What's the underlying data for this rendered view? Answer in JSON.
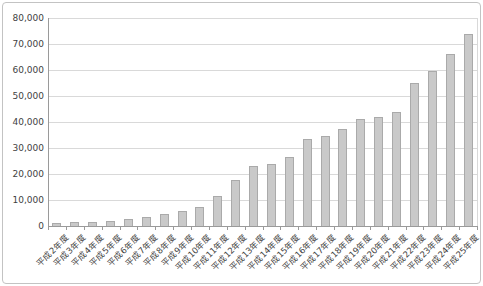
{
  "chart_data": {
    "type": "bar",
    "title": "",
    "xlabel": "",
    "ylabel": "",
    "categories": [
      "平成2年度",
      "平成3年度",
      "平成4年度",
      "平成5年度",
      "平成6年度",
      "平成7年度",
      "平成8年度",
      "平成9年度",
      "平成10年度",
      "平成11年度",
      "平成12年度",
      "平成13年度",
      "平成14年度",
      "平成15年度",
      "平成16年度",
      "平成17年度",
      "平成18年度",
      "平成19年度",
      "平成20年度",
      "平成21年度",
      "平成22年度",
      "平成23年度",
      "平成24年度",
      "平成25年度"
    ],
    "values": [
      1000,
      1500,
      1600,
      2000,
      2500,
      3300,
      4500,
      5800,
      7400,
      11500,
      17500,
      23000,
      23700,
      26500,
      33300,
      34600,
      37400,
      41000,
      42000,
      44000,
      55000,
      59500,
      66000,
      74000
    ],
    "ylim": [
      0,
      80000
    ],
    "y_tick_step": 10000,
    "y_tick_labels": [
      "0",
      "10,000",
      "20,000",
      "30,000",
      "40,000",
      "50,000",
      "60,000",
      "70,000",
      "80,000"
    ],
    "grid": "horizontal",
    "legend": "none",
    "bar_color": "#c9c9c9",
    "bar_border_color": "#aaaaaa",
    "gridline_color": "#d9d9d9",
    "axis_color": "#9a9a9a",
    "text_color": "#3f3f3f"
  }
}
